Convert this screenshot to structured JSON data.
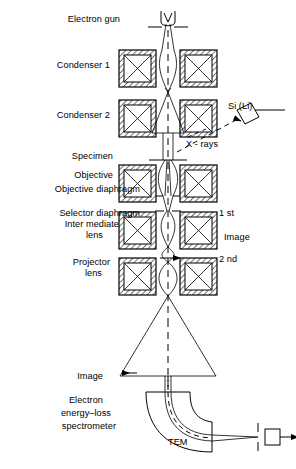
{
  "figure": {
    "instrument": "TEM",
    "background_color": "#ffffff",
    "line_color": "#000000"
  },
  "labels_left": [
    {
      "id": "electron-gun",
      "text": "Electron gun",
      "x": 120,
      "y": 14,
      "align": "right"
    },
    {
      "id": "condenser-1",
      "text": "Condenser 1",
      "x": 110,
      "y": 64,
      "align": "right"
    },
    {
      "id": "condenser-2",
      "text": "Condenser 2",
      "x": 110,
      "y": 114,
      "align": "right"
    },
    {
      "id": "specimen",
      "text": "Specimen",
      "x": 113,
      "y": 155,
      "align": "right"
    },
    {
      "id": "objective",
      "text": "Objective",
      "x": 113,
      "y": 174,
      "align": "right"
    },
    {
      "id": "objective-diaphragm",
      "text": "Objective diaphragm",
      "x": 140,
      "y": 188,
      "align": "right"
    },
    {
      "id": "selector-diaphragm",
      "text": "Selector diaphragm",
      "x": 140,
      "y": 212,
      "align": "right"
    },
    {
      "id": "intermediate-lens-1",
      "text": "Inter mediate",
      "x": 119,
      "y": 223,
      "align": "right"
    },
    {
      "id": "intermediate-lens-2",
      "text": "lens",
      "x": 103,
      "y": 234,
      "align": "right"
    },
    {
      "id": "projector-lens-1",
      "text": "Projector",
      "x": 110,
      "y": 261,
      "align": "right"
    },
    {
      "id": "projector-lens-2",
      "text": "lens",
      "x": 102,
      "y": 272,
      "align": "right"
    },
    {
      "id": "image",
      "text": "Image",
      "x": 103,
      "y": 375,
      "align": "right"
    },
    {
      "id": "eels-1",
      "text": "Electron",
      "x": 103,
      "y": 399,
      "align": "right"
    },
    {
      "id": "eels-2",
      "text": "energy–loss",
      "x": 111,
      "y": 412,
      "align": "right"
    },
    {
      "id": "eels-3",
      "text": "spectrometer",
      "x": 116,
      "y": 425,
      "align": "right"
    }
  ],
  "labels_right": [
    {
      "id": "si-li-detector",
      "text": "Si (Li)",
      "x": 228,
      "y": 105,
      "align": "left"
    },
    {
      "id": "x-rays",
      "text": "X - rays",
      "x": 186,
      "y": 143,
      "align": "left"
    },
    {
      "id": "first-image",
      "text": "1 st",
      "x": 215,
      "y": 212,
      "align": "left"
    },
    {
      "id": "image-right",
      "text": "Image",
      "x": 220,
      "y": 236,
      "align": "left"
    },
    {
      "id": "second-image",
      "text": "2 nd",
      "x": 215,
      "y": 258,
      "align": "left"
    },
    {
      "id": "tem-label",
      "text": "TEM",
      "x": 168,
      "y": 441,
      "align": "left"
    }
  ],
  "optics": {
    "axis_x": 168,
    "lens_boxes": [
      {
        "id": "condenser-1-lens",
        "y": 50,
        "size": 37
      },
      {
        "id": "condenser-2-lens",
        "y": 100,
        "size": 37
      },
      {
        "id": "objective-lens",
        "y": 165,
        "size": 37
      },
      {
        "id": "intermediate-lens",
        "y": 212,
        "size": 37
      },
      {
        "id": "projector-lens",
        "y": 258,
        "size": 37
      }
    ]
  }
}
